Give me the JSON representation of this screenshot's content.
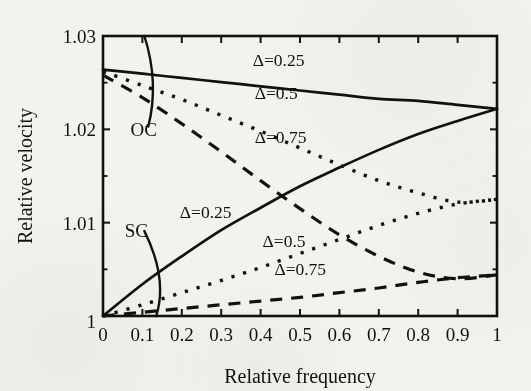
{
  "chart_data": {
    "type": "line",
    "title": "",
    "xlabel": "Relative frequency",
    "ylabel": "Relative velocity",
    "xlim": [
      0,
      1
    ],
    "ylim": [
      1,
      1.03
    ],
    "grid": false,
    "legend_position": "inline-annotations",
    "xticks": [
      "0",
      "0.1",
      "0.2",
      "0.3",
      "0.4",
      "0.5",
      "0.6",
      "0.7",
      "0.8",
      "0.9",
      "1"
    ],
    "xtick_values": [
      0,
      0.1,
      0.2,
      0.3,
      0.4,
      0.5,
      0.6,
      0.7,
      0.8,
      0.9,
      1
    ],
    "yticks": [
      "1",
      "1.01",
      "1.02",
      "1.03"
    ],
    "ytick_values": [
      1,
      1.01,
      1.02,
      1.03
    ],
    "yminor_values": [
      1.005,
      1.015,
      1.025
    ],
    "annotations": [
      {
        "text": "OC",
        "x": 0.07,
        "y": 1.0193
      },
      {
        "text": "SC",
        "x": 0.055,
        "y": 1.0085
      }
    ],
    "series": [
      {
        "name": "OC delta=0.25",
        "group": "OC",
        "delta": "0.25",
        "style": "solid",
        "label": "Δ=0.25",
        "label_x": 0.38,
        "label_y": 1.0268,
        "x": [
          0,
          0.1,
          0.2,
          0.3,
          0.4,
          0.5,
          0.6,
          0.7,
          0.8,
          0.9,
          1
        ],
        "y": [
          1.0264,
          1.02596,
          1.02551,
          1.02506,
          1.02461,
          1.02416,
          1.02371,
          1.02326,
          1.02305,
          1.02262,
          1.0222
        ]
      },
      {
        "name": "OC delta=0.5",
        "group": "OC",
        "delta": "0.5",
        "style": "dotted",
        "label": "Δ=0.5",
        "label_x": 0.385,
        "label_y": 1.0232,
        "x": [
          0,
          0.1,
          0.2,
          0.3,
          0.4,
          0.5,
          0.6,
          0.7,
          0.8,
          0.9,
          1
        ],
        "y": [
          1.0262,
          1.0247,
          1.0232,
          1.0215,
          1.0198,
          1.018,
          1.0162,
          1.0145,
          1.0132,
          1.0122,
          1.0125
        ]
      },
      {
        "name": "OC delta=0.75",
        "group": "OC",
        "delta": "0.75",
        "style": "dashed",
        "label": "Δ=0.75",
        "label_x": 0.385,
        "label_y": 1.0185,
        "x": [
          0,
          0.1,
          0.2,
          0.3,
          0.4,
          0.5,
          0.6,
          0.7,
          0.8,
          0.9,
          1
        ],
        "y": [
          1.0258,
          1.0234,
          1.0206,
          1.0176,
          1.0145,
          1.0115,
          1.0087,
          1.0064,
          1.0047,
          1.004,
          1.0044
        ]
      },
      {
        "name": "SC delta=0.25",
        "group": "SC",
        "delta": "0.25",
        "style": "solid",
        "label": "Δ=0.25",
        "label_x": 0.195,
        "label_y": 1.0105,
        "x": [
          0,
          0.1,
          0.2,
          0.3,
          0.4,
          0.5,
          0.6,
          0.7,
          0.8,
          0.9,
          1
        ],
        "y": [
          1.0,
          1.0034,
          1.0064,
          1.0092,
          1.0116,
          1.0139,
          1.0159,
          1.0178,
          1.0195,
          1.0209,
          1.0222
        ]
      },
      {
        "name": "SC delta=0.5",
        "group": "SC",
        "delta": "0.5",
        "style": "dotted",
        "label": "Δ=0.5",
        "label_x": 0.405,
        "label_y": 1.0074,
        "x": [
          0,
          0.1,
          0.2,
          0.3,
          0.4,
          0.5,
          0.6,
          0.7,
          0.8,
          0.9,
          1
        ],
        "y": [
          1.0,
          1.0012,
          1.0025,
          1.0038,
          1.0052,
          1.0067,
          1.0082,
          1.0097,
          1.011,
          1.012,
          1.0125
        ]
      },
      {
        "name": "SC delta=0.75",
        "group": "SC",
        "delta": "0.75",
        "style": "dashed",
        "label": "Δ=0.75",
        "label_x": 0.435,
        "label_y": 1.0044,
        "x": [
          0,
          0.1,
          0.2,
          0.3,
          0.4,
          0.5,
          0.6,
          0.7,
          0.8,
          0.9,
          1
        ],
        "y": [
          1.0,
          1.0004,
          1.0008,
          1.0012,
          1.0016,
          1.002,
          1.0025,
          1.003,
          1.0036,
          1.0041,
          1.0044
        ]
      }
    ],
    "leader_arcs": [
      {
        "name": "oc-leader-arc",
        "points": [
          [
            0.105,
            1.03
          ],
          [
            0.143,
            1.025
          ],
          [
            0.115,
            1.0203
          ]
        ]
      },
      {
        "name": "sc-leader-arc",
        "points": [
          [
            0.105,
            1.0091
          ],
          [
            0.165,
            1.004
          ],
          [
            0.135,
            1.0
          ]
        ]
      }
    ]
  }
}
